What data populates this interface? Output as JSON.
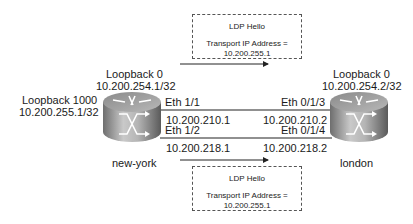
{
  "diagram": {
    "routers": [
      {
        "name": "new-york",
        "loopback0": {
          "label": "Loopback 0",
          "ip": "10.200.254.1/32"
        },
        "loopback1000": {
          "label": "Loopback 1000",
          "ip": "10.200.255.1/32"
        }
      },
      {
        "name": "london",
        "loopback0": {
          "label": "Loopback 0",
          "ip": "10.200.254.2/32"
        }
      }
    ],
    "links": [
      {
        "a_if": "Eth 1/1",
        "a_ip": "10.200.210.1",
        "b_if": "Eth 0/1/3",
        "b_ip": "10.200.210.2"
      },
      {
        "a_if": "Eth 1/2",
        "a_ip": "10.200.218.1",
        "b_if": "Eth 0/1/4",
        "b_ip": "10.200.218.2"
      }
    ],
    "messages": [
      {
        "title": "LDP Hello",
        "line1": "Transport IP Address =",
        "line2": "10.200.255.1"
      },
      {
        "title": "LDP Hello",
        "line1": "Transport IP Address =",
        "line2": "10.200.255.1"
      }
    ]
  }
}
